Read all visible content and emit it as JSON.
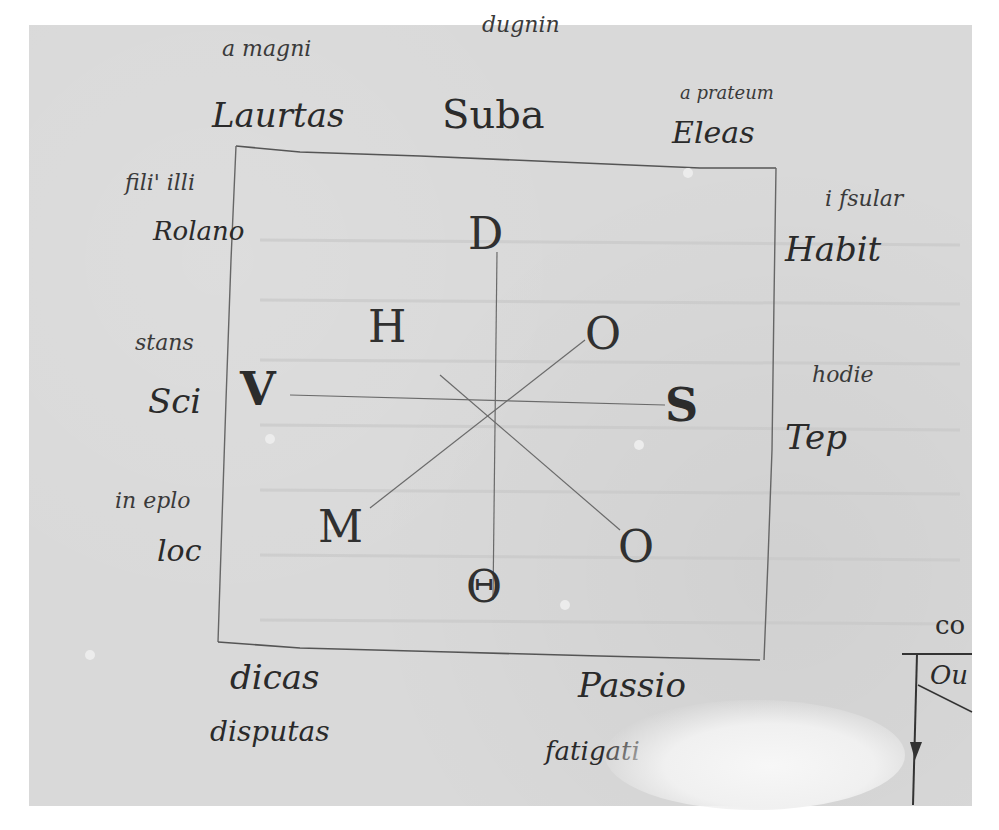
{
  "document": {
    "type": "manuscript-folio-fragment",
    "diagram": {
      "shape": "square with crossing lines",
      "center_letters": {
        "top": "D",
        "upper_left": "H",
        "upper_right": "O",
        "left": "V",
        "right": "S",
        "lower_left": "M",
        "lower_right": "O",
        "bottom": "Θ"
      }
    },
    "top_margin": {
      "left_gloss": "a magni",
      "left_word": "Laurtas",
      "center_gloss": "dugnin",
      "center_word": "Suba",
      "right_gloss": "a prateum",
      "right_word": "Eleas"
    },
    "left_margin": [
      {
        "gloss": "fili' illi",
        "word": "Rolano"
      },
      {
        "gloss": "stans",
        "word": "Sci"
      },
      {
        "gloss": "in eplo",
        "word": "loc"
      }
    ],
    "right_margin": [
      {
        "gloss": "i fsular",
        "word": "Habit"
      },
      {
        "gloss": "hodie",
        "word": "Tep"
      }
    ],
    "bottom_margin": {
      "left_word": "dicas",
      "left_gloss": "disputas",
      "right_word": "Passio",
      "right_gloss": "fatigati"
    },
    "right_edge_fragment": {
      "word": "co",
      "boxed_text": "Ou"
    }
  },
  "colors": {
    "parchment": "#d9d9d9",
    "ink": "#2b2b2b",
    "background": "#ffffff"
  }
}
